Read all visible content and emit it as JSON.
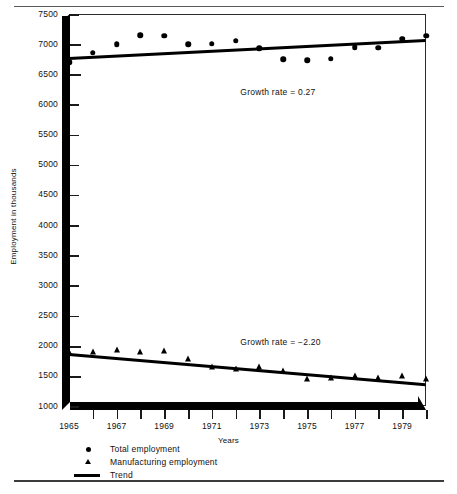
{
  "chart_data": {
    "type": "scatter",
    "title": "",
    "xlabel": "Years",
    "ylabel": "Employment in thousands",
    "grid": false,
    "legend_position": "below-left",
    "xlim": [
      1965,
      1980
    ],
    "ylim": [
      1000,
      7500
    ],
    "y_ticks": [
      1000,
      1500,
      2000,
      2500,
      3000,
      3500,
      4000,
      4500,
      5000,
      5500,
      6000,
      6500,
      7000,
      7500
    ],
    "x_ticks": [
      1965,
      1966,
      1967,
      1968,
      1969,
      1970,
      1971,
      1972,
      1973,
      1974,
      1975,
      1976,
      1977,
      1978,
      1979,
      1980
    ],
    "x_tick_labels": [
      "1965",
      "",
      "1967",
      "",
      "1969",
      "",
      "1971",
      "",
      "1973",
      "",
      "1975",
      "",
      "1977",
      "",
      "1979",
      ""
    ],
    "x": [
      1965,
      1966,
      1967,
      1968,
      1969,
      1970,
      1971,
      1972,
      1973,
      1974,
      1975,
      1976,
      1977,
      1978,
      1979,
      1980
    ],
    "series": [
      {
        "name": "Total employment",
        "marker": "circle",
        "values": [
          6700,
          6860,
          7000,
          7150,
          7140,
          7000,
          7010,
          7060,
          6930,
          6750,
          6730,
          6760,
          6950,
          6940,
          7090,
          7140
        ]
      },
      {
        "name": "Manufacturing employment",
        "marker": "triangle",
        "values": [
          1900,
          1900,
          1930,
          1900,
          1910,
          1780,
          1650,
          1620,
          1640,
          1580,
          1440,
          1460,
          1490,
          1470,
          1500,
          1440
        ]
      }
    ],
    "trends": [
      {
        "name": "Total employment trend",
        "x_start": 1965,
        "y_start": 6790,
        "x_end": 1980,
        "y_end": 7090,
        "growth_rate": 0.27,
        "label": "Growth rate =  0.27"
      },
      {
        "name": "Manufacturing employment trend",
        "x_start": 1965,
        "y_start": 1880,
        "x_end": 1980,
        "y_end": 1380,
        "growth_rate": -2.2,
        "label": "Growth rate =  −2.20"
      }
    ],
    "annotations": [
      {
        "text": "Growth rate =  0.27",
        "x": 1972.2,
        "y": 6200
      },
      {
        "text": "Growth rate =  −2.20",
        "x": 1972.2,
        "y": 2060
      }
    ]
  },
  "axes": {
    "y_title": "Employment in thousands",
    "x_title": "Years",
    "y_tick_labels": [
      "7500",
      "7000",
      "6500",
      "6000",
      "5500",
      "5000",
      "4500",
      "4000",
      "3500",
      "3000",
      "2500",
      "2000",
      "1500",
      "1000"
    ],
    "x_tick_labels": [
      "1965",
      "1967",
      "1969",
      "1971",
      "1973",
      "1975",
      "1977",
      "1979"
    ]
  },
  "legend": {
    "items": [
      {
        "label": "Total employment",
        "marker": "circle-marker-icon"
      },
      {
        "label": "Manufacturing employment",
        "marker": "triangle-marker-icon"
      },
      {
        "label": "Trend",
        "marker": "line-marker-icon"
      }
    ]
  },
  "colors": {
    "ink": "#000000",
    "background": "#ffffff",
    "rule": "#5a5a5a"
  }
}
